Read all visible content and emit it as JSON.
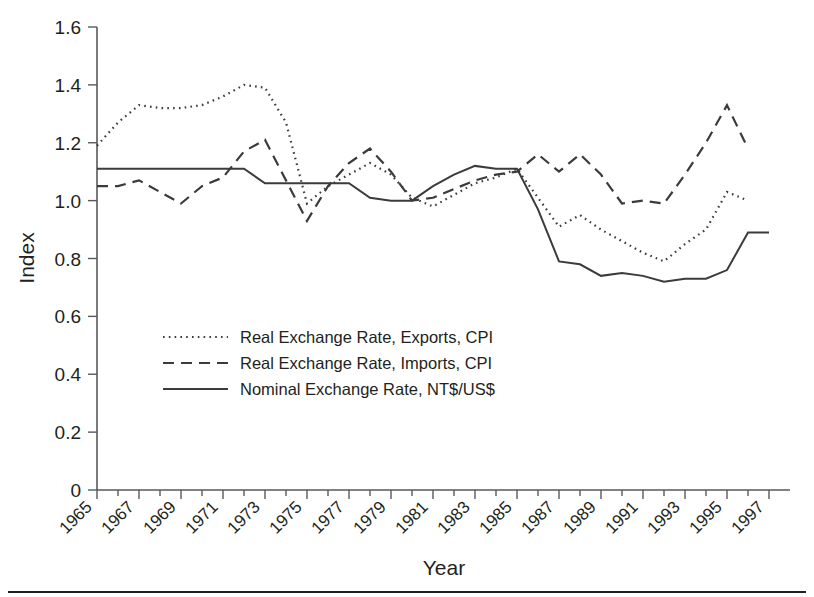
{
  "chart_data": {
    "type": "line",
    "title": "",
    "xlabel": "Year",
    "ylabel": "Index",
    "xlim": [
      1965,
      1998
    ],
    "ylim": [
      0,
      1.6
    ],
    "grid": false,
    "legend_position": "inside-lower-left",
    "y_ticks": [
      "0",
      "0.2",
      "0.4",
      "0.6",
      "0.8",
      "1.0",
      "1.2",
      "1.4",
      "1.6"
    ],
    "y_tick_values": [
      0,
      0.2,
      0.4,
      0.6,
      0.8,
      1.0,
      1.2,
      1.4,
      1.6
    ],
    "x_ticks": [
      "1965",
      "1967",
      "1969",
      "1971",
      "1973",
      "1975",
      "1977",
      "1979",
      "1981",
      "1983",
      "1985",
      "1987",
      "1989",
      "1991",
      "1993",
      "1995",
      "1997"
    ],
    "x_tick_values": [
      1965,
      1967,
      1969,
      1971,
      1973,
      1975,
      1977,
      1979,
      1981,
      1983,
      1985,
      1987,
      1989,
      1991,
      1993,
      1995,
      1997
    ],
    "x": [
      1965,
      1966,
      1967,
      1968,
      1969,
      1970,
      1971,
      1972,
      1973,
      1974,
      1975,
      1976,
      1977,
      1978,
      1979,
      1980,
      1981,
      1982,
      1983,
      1984,
      1985,
      1986,
      1987,
      1988,
      1989,
      1990,
      1991,
      1992,
      1993,
      1994,
      1995,
      1996,
      1997
    ],
    "series": [
      {
        "name": "Real Exchange Rate, Exports, CPI",
        "style": "dotted",
        "color": "#6d6e71",
        "values": [
          1.19,
          1.27,
          1.33,
          1.32,
          1.32,
          1.33,
          1.36,
          1.4,
          1.39,
          1.27,
          0.99,
          1.05,
          1.09,
          1.13,
          1.09,
          1.01,
          0.98,
          1.02,
          1.06,
          1.08,
          1.11,
          1.01,
          0.91,
          0.95,
          0.9,
          0.86,
          0.82,
          0.79,
          0.85,
          0.9,
          1.03,
          1.0,
          null
        ]
      },
      {
        "name": "Real Exchange Rate, Imports, CPI",
        "style": "dashed",
        "color": "#3b3b3d",
        "values": [
          1.05,
          1.05,
          1.07,
          1.03,
          0.99,
          1.05,
          1.08,
          1.17,
          1.21,
          1.07,
          0.93,
          1.05,
          1.13,
          1.18,
          1.1,
          1.0,
          1.01,
          1.04,
          1.07,
          1.09,
          1.1,
          1.16,
          1.1,
          1.16,
          1.09,
          0.99,
          1.0,
          0.99,
          1.09,
          1.2,
          1.33,
          1.18,
          null
        ]
      },
      {
        "name": "Nominal Exchange Rate, NT$/US$",
        "style": "solid",
        "color": "#3b3b3d",
        "values": [
          1.11,
          1.11,
          1.11,
          1.11,
          1.11,
          1.11,
          1.11,
          1.11,
          1.06,
          1.06,
          1.06,
          1.06,
          1.06,
          1.01,
          1.0,
          1.0,
          1.05,
          1.09,
          1.12,
          1.11,
          1.11,
          0.97,
          0.79,
          0.78,
          0.74,
          0.75,
          0.74,
          0.72,
          0.73,
          0.73,
          0.76,
          0.89,
          0.89
        ]
      }
    ]
  },
  "legend": {
    "items": [
      {
        "label": "Real Exchange Rate, Exports, CPI",
        "style": "dotted"
      },
      {
        "label": "Real Exchange Rate, Imports, CPI",
        "style": "dashed"
      },
      {
        "label": "Nominal Exchange Rate, NT$/US$",
        "style": "solid"
      }
    ]
  },
  "axes": {
    "y_title": "Index",
    "x_title": "Year"
  }
}
